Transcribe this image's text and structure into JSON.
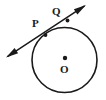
{
  "figure": {
    "kind": "geometry-diagram",
    "background_color": "#ffffff",
    "stroke_color": "#1a1a1a",
    "canvas": {
      "width": 106,
      "height": 100
    }
  },
  "circle": {
    "name": "circle-O",
    "center_label": "O",
    "center_x": 64.5,
    "center_y": 60,
    "radius": 32.5,
    "stroke_width": 1.6,
    "fill": "none"
  },
  "center_point": {
    "name": "center-dot",
    "x": 65,
    "y": 58,
    "radius": 2.2
  },
  "secant": {
    "name": "secant-line-PQ",
    "start_x": 6,
    "start_y": 57.5,
    "end_x": 86,
    "end_y": 5,
    "stroke_width": 1.5,
    "arrow_start": true,
    "arrow_end": true
  },
  "points": [
    {
      "label": "P",
      "x": 45.5,
      "y": 35.0,
      "marker_radius": 1.9
    },
    {
      "label": "Q",
      "x": 67.5,
      "y": 20.5,
      "marker_radius": 1.9
    }
  ],
  "labels": {
    "p": "P",
    "q": "Q",
    "o": "O"
  },
  "colors": {
    "ink": "#1a1a1a",
    "paper": "#ffffff"
  }
}
